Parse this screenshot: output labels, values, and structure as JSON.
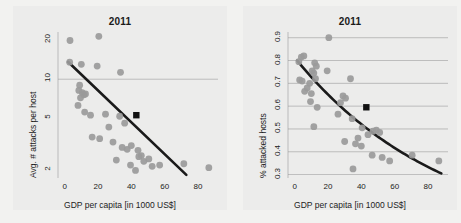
{
  "figure": {
    "background_color": "#f2f2f0",
    "panel_background_color": "#ececeb",
    "point_color": "#9a9a9a",
    "trend_color": "#1a1a1a",
    "highlight_color": "#111111",
    "grid_color": "#9c9c9c"
  },
  "panels": [
    {
      "key": "left",
      "title": "2011",
      "xlabel": "GDP per capita [in 1000 US$]",
      "ylabel": "Avg. # attacks per host"
    },
    {
      "key": "right",
      "title": "2011",
      "xlabel": "GDP per capita [in 1000 US$]",
      "ylabel": "% attacked hosts"
    }
  ],
  "chart_data": [
    {
      "type": "scatter",
      "panel": "left",
      "title": "2011",
      "xlabel": "GDP per capita [in 1000 US$]",
      "ylabel": "Avg. # attacks per host",
      "xlim": [
        -4,
        92
      ],
      "ylim": [
        1.75,
        23
      ],
      "yscale": "log",
      "xscale": "linear",
      "grid": true,
      "gridlines_y": [
        10
      ],
      "xticks": [
        0,
        20,
        40,
        60,
        80
      ],
      "yticks": [
        2,
        5,
        10,
        20
      ],
      "legend": null,
      "series": [
        {
          "name": "countries",
          "marker": "circle",
          "color": "#9a9a9a",
          "points": [
            [
              3.2,
              19.8
            ],
            [
              20.5,
              21.3
            ],
            [
              3.0,
              13.5
            ],
            [
              10.0,
              13.0
            ],
            [
              19.5,
              12.6
            ],
            [
              33.5,
              11.3
            ],
            [
              8.5,
              8.2
            ],
            [
              9.0,
              9.0
            ],
            [
              10.5,
              7.9
            ],
            [
              11.5,
              7.6
            ],
            [
              12.5,
              7.7
            ],
            [
              9.5,
              7.2
            ],
            [
              8.0,
              6.3
            ],
            [
              12.0,
              5.6
            ],
            [
              15.5,
              5.3
            ],
            [
              24.5,
              5.4
            ],
            [
              33.0,
              5.2
            ],
            [
              36.0,
              4.6
            ],
            [
              26.5,
              4.3
            ],
            [
              16.5,
              3.6
            ],
            [
              21.0,
              3.5
            ],
            [
              29.0,
              3.3
            ],
            [
              34.5,
              3.0
            ],
            [
              37.5,
              2.9
            ],
            [
              40.0,
              3.1
            ],
            [
              44.0,
              2.85
            ],
            [
              46.0,
              2.6
            ],
            [
              31.0,
              2.4
            ],
            [
              39.5,
              2.2
            ],
            [
              42.5,
              2.0
            ],
            [
              44.5,
              2.55
            ],
            [
              47.5,
              2.35
            ],
            [
              50.5,
              2.45
            ],
            [
              52.5,
              2.15
            ],
            [
              57.0,
              2.2
            ],
            [
              71.5,
              2.25
            ],
            [
              86.5,
              2.1
            ]
          ]
        },
        {
          "name": "highlighted country",
          "marker": "square",
          "color": "#111111",
          "points": [
            [
              43.0,
              5.3
            ]
          ]
        }
      ],
      "trend": {
        "type": "linear-on-log-y",
        "color": "#1a1a1a",
        "x_start": 2.0,
        "y_start": 13.6,
        "x_end": 73.0,
        "y_end": 1.85
      }
    },
    {
      "type": "scatter",
      "panel": "right",
      "title": "2011",
      "xlabel": "GDP per capita [in 1000 US$]",
      "ylabel": "% attacked hosts",
      "xlim": [
        -4,
        92
      ],
      "ylim": [
        0.285,
        0.925
      ],
      "yscale": "linear",
      "xscale": "linear",
      "grid": true,
      "gridlines_y": [
        0.3,
        0.4,
        0.5,
        0.6,
        0.7,
        0.8,
        0.9
      ],
      "xticks": [
        0,
        20,
        40,
        60,
        80
      ],
      "yticks": [
        0.3,
        0.4,
        0.5,
        0.6,
        0.7,
        0.8,
        0.9
      ],
      "legend": null,
      "series": [
        {
          "name": "countries",
          "marker": "circle",
          "color": "#9a9a9a",
          "points": [
            [
              20.5,
              0.9
            ],
            [
              4.0,
              0.815
            ],
            [
              5.5,
              0.82
            ],
            [
              2.5,
              0.795
            ],
            [
              12.0,
              0.79
            ],
            [
              13.0,
              0.775
            ],
            [
              19.5,
              0.755
            ],
            [
              11.5,
              0.745
            ],
            [
              10.5,
              0.755
            ],
            [
              3.0,
              0.715
            ],
            [
              4.5,
              0.71
            ],
            [
              12.5,
              0.72
            ],
            [
              9.0,
              0.7
            ],
            [
              33.5,
              0.72
            ],
            [
              7.5,
              0.68
            ],
            [
              6.0,
              0.665
            ],
            [
              10.0,
              0.655
            ],
            [
              29.0,
              0.645
            ],
            [
              30.5,
              0.635
            ],
            [
              9.5,
              0.62
            ],
            [
              27.5,
              0.615
            ],
            [
              13.5,
              0.595
            ],
            [
              26.0,
              0.565
            ],
            [
              34.5,
              0.545
            ],
            [
              11.5,
              0.51
            ],
            [
              40.5,
              0.505
            ],
            [
              47.0,
              0.49
            ],
            [
              49.0,
              0.495
            ],
            [
              51.0,
              0.485
            ],
            [
              44.0,
              0.475
            ],
            [
              38.0,
              0.46
            ],
            [
              30.0,
              0.445
            ],
            [
              36.5,
              0.435
            ],
            [
              40.0,
              0.425
            ],
            [
              46.5,
              0.385
            ],
            [
              52.5,
              0.375
            ],
            [
              57.0,
              0.36
            ],
            [
              70.5,
              0.385
            ],
            [
              86.5,
              0.36
            ],
            [
              35.0,
              0.325
            ]
          ]
        },
        {
          "name": "highlighted country",
          "marker": "square",
          "color": "#111111",
          "points": [
            [
              43.0,
              0.595
            ]
          ]
        }
      ],
      "trend": {
        "type": "exponential-decay",
        "color": "#1a1a1a",
        "x_start": 1.5,
        "y_start": 0.8,
        "x_end": 88.0,
        "y_end": 0.305
      }
    }
  ]
}
